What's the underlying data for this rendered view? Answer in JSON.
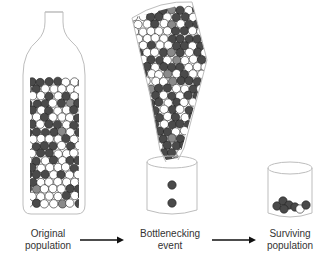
{
  "labels": {
    "original": [
      "Original",
      "population"
    ],
    "bottleneck": [
      "Bottlenecking",
      "event"
    ],
    "surviving": [
      "Surviving",
      "population"
    ]
  },
  "colors": {
    "white_ball": "#ffffff",
    "dark_ball": "#4a4a4a",
    "gray_ball": "#8a8a8a",
    "outline": "#bdbdbd",
    "arrow": "#111111",
    "text": "#333333"
  },
  "surviving_balls": [
    "dark",
    "dark",
    "dark",
    "dark",
    "dark",
    "white",
    "dark"
  ],
  "falling_balls": [
    "dark",
    "dark"
  ]
}
